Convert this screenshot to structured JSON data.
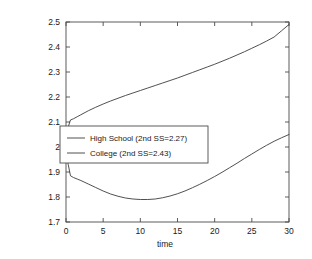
{
  "chart_data": {
    "type": "line",
    "title": "",
    "xlabel": "time",
    "ylabel": "",
    "xlim": [
      0,
      30
    ],
    "ylim": [
      1.7,
      2.5
    ],
    "xticks": [
      0,
      5,
      10,
      15,
      20,
      25,
      30
    ],
    "xtick_labels": [
      "0",
      "5",
      "10",
      "15",
      "20",
      "25",
      "30"
    ],
    "yticks": [
      1.7,
      1.8,
      1.9,
      2.0,
      2.1,
      2.2,
      2.3,
      2.4,
      2.5
    ],
    "ytick_labels": [
      "1.7",
      "1.8",
      "1.9",
      "2",
      "2.1",
      "2.2",
      "2.3",
      "2.4",
      "2.5"
    ],
    "grid": false,
    "legend_position": "center-left",
    "line_color": "#3c3c3c",
    "frame_color": "#4a4a4a",
    "background": "#ffffff",
    "series": [
      {
        "name": "High School (2nd SS=2.27)",
        "legend_label": "High School (2nd SS=2.27)",
        "second_ss": 2.27,
        "x": [
          0,
          0.3,
          0.6,
          1,
          1.5,
          2,
          3,
          4,
          5,
          6,
          7,
          8,
          9,
          10,
          11,
          12,
          13,
          14,
          15,
          16,
          17,
          18,
          19,
          20,
          21,
          22,
          23,
          24,
          25,
          26,
          27,
          28,
          29,
          30
        ],
        "y": [
          2.0,
          1.93,
          1.885,
          1.878,
          1.872,
          1.866,
          1.852,
          1.838,
          1.824,
          1.812,
          1.803,
          1.796,
          1.792,
          1.79,
          1.79,
          1.792,
          1.797,
          1.804,
          1.813,
          1.824,
          1.837,
          1.851,
          1.866,
          1.882,
          1.899,
          1.917,
          1.935,
          1.954,
          1.972,
          1.99,
          2.007,
          2.023,
          2.037,
          2.05
        ]
      },
      {
        "name": "College (2nd SS=2.43)",
        "legend_label": "College (2nd SS=2.43)",
        "second_ss": 2.43,
        "x": [
          0,
          0.3,
          0.6,
          1,
          1.5,
          2,
          3,
          4,
          5,
          6,
          7,
          8,
          9,
          10,
          11,
          12,
          13,
          14,
          15,
          16,
          17,
          18,
          19,
          20,
          21,
          22,
          23,
          24,
          25,
          26,
          27,
          28,
          29,
          30
        ],
        "y": [
          2.0,
          2.08,
          2.108,
          2.113,
          2.121,
          2.129,
          2.145,
          2.159,
          2.172,
          2.184,
          2.195,
          2.206,
          2.216,
          2.226,
          2.236,
          2.246,
          2.256,
          2.266,
          2.276,
          2.287,
          2.298,
          2.309,
          2.32,
          2.331,
          2.343,
          2.355,
          2.368,
          2.381,
          2.395,
          2.409,
          2.424,
          2.44,
          2.465,
          2.49
        ]
      }
    ]
  }
}
